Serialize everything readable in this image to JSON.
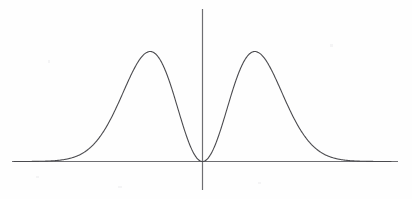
{
  "figure": {
    "title": "",
    "background_color": "#fefefe",
    "width": 412,
    "height": 199
  },
  "axes": {
    "x_axis_label": "",
    "y_axis_label": "",
    "axis_color": "#6e6e72",
    "x_axis_start_px": 12,
    "x_axis_end_px": 398,
    "x_axis_y_px": 161,
    "y_axis_x_px": 202,
    "y_axis_top_px": 9,
    "y_axis_bottom_px": 190,
    "ticks_visible": false,
    "tick_labels_x": [],
    "tick_labels_y": [],
    "grid": false
  },
  "curve": {
    "color": "#4a4a4e",
    "line_width": 1.1,
    "style": "solid",
    "label": ""
  },
  "annotations": {
    "origin_note": "curve touches zero at x = 0",
    "peak_left_note": "left maximum",
    "peak_right_note": "right maximum"
  },
  "chart_data": {
    "type": "line",
    "title": "",
    "subtitle": "",
    "xlabel": "",
    "ylabel": "",
    "legend": [],
    "legend_position": "none",
    "grid": false,
    "xlim": [
      -3.6,
      3.6
    ],
    "ylim": [
      0,
      0.42
    ],
    "function": "f(x) = x^2 * exp(-x^2)",
    "peaks": [
      {
        "x": -1.0,
        "y": 0.3679
      },
      {
        "x": 1.0,
        "y": 0.3679
      }
    ],
    "minima": [
      {
        "x": 0.0,
        "y": 0.0
      }
    ],
    "series": [
      {
        "name": "f(x)",
        "x": [
          -3.6,
          -3.4,
          -3.2,
          -3.0,
          -2.8,
          -2.6,
          -2.4,
          -2.2,
          -2.0,
          -1.8,
          -1.6,
          -1.4,
          -1.2,
          -1.0,
          -0.8,
          -0.6,
          -0.4,
          -0.2,
          0.0,
          0.2,
          0.4,
          0.6,
          0.8,
          1.0,
          1.2,
          1.4,
          1.6,
          1.8,
          2.0,
          2.2,
          2.4,
          2.6,
          2.8,
          3.0,
          3.2,
          3.4,
          3.6
        ],
        "y": [
          0.0,
          0.0001,
          0.0004,
          0.0011,
          0.003,
          0.0078,
          0.0181,
          0.0379,
          0.0733,
          0.1265,
          0.1969,
          0.2738,
          0.3397,
          0.3679,
          0.3373,
          0.2513,
          0.1363,
          0.0384,
          0.0,
          0.0384,
          0.1363,
          0.2513,
          0.3373,
          0.3679,
          0.3397,
          0.2738,
          0.1969,
          0.1265,
          0.0733,
          0.0379,
          0.0181,
          0.0078,
          0.003,
          0.0011,
          0.0004,
          0.0001,
          0.0
        ]
      }
    ]
  }
}
